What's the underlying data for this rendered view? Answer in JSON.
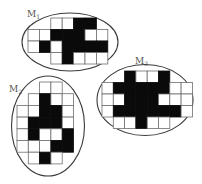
{
  "figure": {
    "colors": {
      "filled": "#0a0a0a",
      "empty": "#ffffff",
      "grid": "#6e6e6e",
      "outline": "#3a3a3a",
      "label": "#555555"
    },
    "matrices": [
      {
        "id": "M1",
        "label_main": "M",
        "label_sub": "1",
        "label_pos": [
          27,
          17
        ],
        "ellipse": {
          "cx": 70,
          "cy": 42,
          "rx": 48,
          "ry": 29
        },
        "origin": [
          28,
          18
        ],
        "cell": [
          11.4,
          11.5
        ],
        "rows": [
          {
            "start": 2,
            "cells": [
              0,
              0,
              1,
              1
            ]
          },
          {
            "start": 0,
            "cells": [
              0,
              0,
              1,
              1,
              1,
              0,
              0
            ]
          },
          {
            "start": 0,
            "cells": [
              0,
              1,
              0,
              1,
              1,
              1,
              1
            ]
          },
          {
            "start": 2,
            "cells": [
              0,
              1,
              0,
              0,
              0
            ]
          }
        ]
      },
      {
        "id": "M2",
        "label_main": "M",
        "label_sub": "2",
        "label_pos": [
          9,
          92
        ],
        "ellipse": {
          "cx": 48,
          "cy": 126,
          "rx": 36.5,
          "ry": 50
        },
        "origin": [
          17,
          82
        ],
        "cell": [
          11.3,
          11.7
        ],
        "rows": [
          {
            "start": 2,
            "cells": [
              0,
              0
            ]
          },
          {
            "start": 1,
            "cells": [
              0,
              1,
              0,
              0
            ]
          },
          {
            "start": 0,
            "cells": [
              0,
              0,
              1,
              1,
              0
            ]
          },
          {
            "start": 0,
            "cells": [
              0,
              1,
              1,
              1,
              0
            ]
          },
          {
            "start": 0,
            "cells": [
              0,
              1,
              0,
              0,
              1
            ]
          },
          {
            "start": 0,
            "cells": [
              0,
              0,
              0,
              1,
              1
            ]
          },
          {
            "start": 1,
            "cells": [
              0,
              1,
              0
            ]
          }
        ]
      },
      {
        "id": "M3",
        "label_main": "M",
        "label_sub": "3",
        "label_pos": [
          135,
          64
        ],
        "ellipse": {
          "cx": 145,
          "cy": 100,
          "rx": 48,
          "ry": 35.5
        },
        "origin": [
          102,
          71
        ],
        "cell": [
          11.3,
          11.5
        ],
        "rows": [
          {
            "start": 2,
            "cells": [
              1,
              0,
              0,
              1
            ]
          },
          {
            "start": 0,
            "cells": [
              0,
              1,
              1,
              1,
              1,
              1,
              0,
              0
            ]
          },
          {
            "start": 0,
            "cells": [
              0,
              0,
              1,
              1,
              1,
              0,
              0,
              0
            ]
          },
          {
            "start": 0,
            "cells": [
              0,
              1,
              1,
              1,
              1,
              1,
              1,
              0
            ]
          },
          {
            "start": 1,
            "cells": [
              0,
              0,
              1,
              0,
              0
            ]
          }
        ]
      }
    ]
  }
}
